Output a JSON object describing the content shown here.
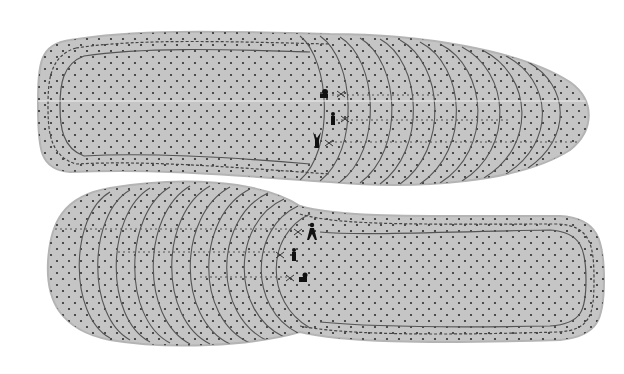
{
  "image": {
    "subject": "Pair of trim-to-size perforated insoles",
    "background": "#ffffff",
    "insole_fill": "#c5c5c5",
    "insole_edge": "#b4b4b4",
    "perforation_color": "#2e2e2e",
    "cut_line_color": "#555555",
    "stitch_color": "#444444"
  },
  "insoles": [
    {
      "name": "top-insole",
      "orientation": "toe-right",
      "size_guides": [
        {
          "icon": "adult-figure-icon",
          "label": "men"
        },
        {
          "icon": "standing-figure-icon",
          "label": "women"
        },
        {
          "icon": "child-figure-icon",
          "label": "kids"
        }
      ],
      "trim_lines": 12
    },
    {
      "name": "bottom-insole",
      "orientation": "toe-left",
      "size_guides": [
        {
          "icon": "adult-figure-icon",
          "label": "men"
        },
        {
          "icon": "standing-figure-icon",
          "label": "women"
        },
        {
          "icon": "child-figure-icon",
          "label": "kids"
        }
      ],
      "trim_lines": 12
    }
  ]
}
